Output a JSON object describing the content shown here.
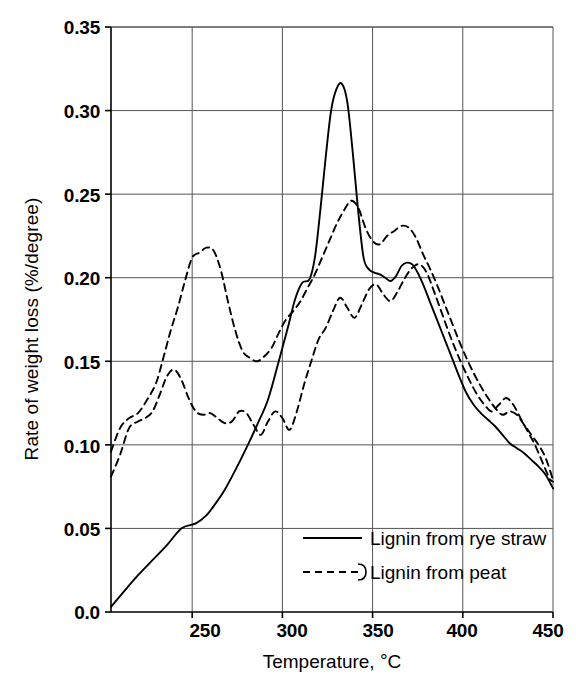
{
  "chart_data": {
    "type": "line",
    "title": "",
    "xlabel": "Temperature, °C",
    "xlabel_main": "Temperature, ",
    "xlabel_deg": "°",
    "xlabel_unit": "C",
    "ylabel": "Rate of weight loss (%/degree)",
    "xlim": [
      205,
      450
    ],
    "ylim": [
      0.0,
      0.35
    ],
    "grid": true,
    "legend_position": "inside-bottom-right",
    "xticks": [
      250,
      300,
      350,
      400,
      450
    ],
    "xtick_labels": [
      "250",
      "300",
      "350",
      "400",
      "450"
    ],
    "yticks": [
      0.0,
      0.05,
      0.1,
      0.15,
      0.2,
      0.25,
      0.3,
      0.35
    ],
    "ytick_labels": [
      "0.0",
      "0.05",
      "0.10",
      "0.15",
      "0.20",
      "0.25",
      "0.30",
      "0.35"
    ],
    "series": [
      {
        "name": "Lignin from rye straw",
        "style": "solid",
        "color": "#000000",
        "x": [
          205,
          212,
          220,
          228,
          236,
          244,
          252,
          258,
          263,
          268,
          274,
          280,
          286,
          292,
          298,
          303,
          307,
          311,
          315,
          318,
          321,
          324,
          327,
          330,
          333,
          336,
          339,
          342,
          345,
          348,
          351,
          354,
          357,
          360,
          363,
          366,
          369,
          372,
          375,
          378,
          382,
          386,
          390,
          394,
          398,
          402,
          406,
          410,
          414,
          418,
          422,
          426,
          430,
          434,
          438,
          442,
          446,
          450
        ],
        "y": [
          0.003,
          0.012,
          0.022,
          0.031,
          0.04,
          0.05,
          0.053,
          0.058,
          0.065,
          0.073,
          0.085,
          0.098,
          0.112,
          0.127,
          0.15,
          0.17,
          0.187,
          0.197,
          0.199,
          0.212,
          0.24,
          0.272,
          0.3,
          0.313,
          0.316,
          0.305,
          0.275,
          0.24,
          0.212,
          0.205,
          0.203,
          0.202,
          0.2,
          0.198,
          0.201,
          0.207,
          0.209,
          0.208,
          0.203,
          0.196,
          0.185,
          0.174,
          0.163,
          0.152,
          0.141,
          0.131,
          0.124,
          0.119,
          0.115,
          0.111,
          0.106,
          0.101,
          0.098,
          0.095,
          0.091,
          0.087,
          0.082,
          0.074
        ]
      },
      {
        "name": "Lignin from peat (upper)",
        "style": "dashed",
        "color": "#000000",
        "x": [
          205,
          210,
          215,
          220,
          225,
          230,
          234,
          238,
          242,
          246,
          250,
          254,
          258,
          262,
          266,
          270,
          274,
          278,
          282,
          286,
          290,
          294,
          298,
          302,
          306,
          310,
          314,
          318,
          322,
          326,
          330,
          334,
          338,
          342,
          346,
          350,
          354,
          358,
          362,
          366,
          370,
          374,
          378,
          382,
          386,
          390,
          394,
          398,
          402,
          406,
          410,
          414,
          418,
          422,
          426,
          430,
          434,
          438,
          442,
          446,
          450
        ],
        "y": [
          0.096,
          0.11,
          0.116,
          0.119,
          0.127,
          0.137,
          0.152,
          0.168,
          0.182,
          0.198,
          0.212,
          0.215,
          0.218,
          0.216,
          0.204,
          0.185,
          0.168,
          0.156,
          0.152,
          0.15,
          0.153,
          0.158,
          0.167,
          0.175,
          0.18,
          0.186,
          0.194,
          0.202,
          0.212,
          0.222,
          0.232,
          0.24,
          0.246,
          0.242,
          0.23,
          0.222,
          0.22,
          0.225,
          0.228,
          0.231,
          0.23,
          0.224,
          0.214,
          0.205,
          0.195,
          0.184,
          0.173,
          0.162,
          0.152,
          0.143,
          0.135,
          0.128,
          0.122,
          0.118,
          0.12,
          0.118,
          0.112,
          0.106,
          0.1,
          0.092,
          0.079
        ]
      },
      {
        "name": "Lignin from peat (lower)",
        "style": "dashed",
        "color": "#000000",
        "x": [
          205,
          210,
          215,
          220,
          224,
          228,
          232,
          236,
          240,
          244,
          248,
          252,
          256,
          260,
          264,
          268,
          272,
          276,
          280,
          284,
          288,
          292,
          296,
          300,
          304,
          308,
          312,
          316,
          320,
          324,
          328,
          332,
          336,
          340,
          344,
          348,
          352,
          356,
          360,
          364,
          368,
          372,
          376,
          380,
          384,
          388,
          392,
          396,
          400,
          404,
          408,
          412,
          416,
          420,
          424,
          428,
          432,
          436,
          440,
          444,
          448,
          450
        ],
        "y": [
          0.081,
          0.094,
          0.11,
          0.114,
          0.116,
          0.12,
          0.13,
          0.141,
          0.145,
          0.139,
          0.128,
          0.12,
          0.118,
          0.119,
          0.116,
          0.113,
          0.114,
          0.12,
          0.119,
          0.112,
          0.106,
          0.114,
          0.12,
          0.116,
          0.109,
          0.12,
          0.136,
          0.15,
          0.163,
          0.17,
          0.18,
          0.188,
          0.182,
          0.176,
          0.184,
          0.193,
          0.196,
          0.19,
          0.186,
          0.192,
          0.2,
          0.206,
          0.208,
          0.203,
          0.192,
          0.18,
          0.168,
          0.157,
          0.147,
          0.138,
          0.13,
          0.124,
          0.12,
          0.124,
          0.128,
          0.124,
          0.116,
          0.108,
          0.1,
          0.09,
          0.08,
          0.078
        ]
      }
    ],
    "legend": [
      {
        "label": "Lignin from rye straw",
        "style": "solid"
      },
      {
        "label": "Lignin from peat",
        "style": "dashed-bracket"
      }
    ]
  }
}
